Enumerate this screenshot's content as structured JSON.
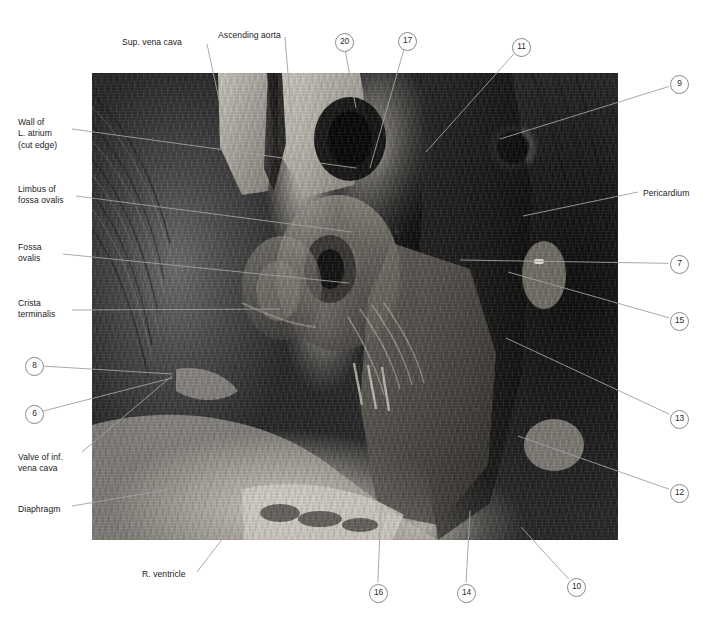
{
  "figure": {
    "type": "anatomical-photograph-plate",
    "photo": {
      "x": 92,
      "y": 73,
      "width": 526,
      "height": 467,
      "rendering": "grayscale-photograph"
    },
    "colors": {
      "background": "#ffffff",
      "label_text": "#1b1b1b",
      "leader_line": "#a0a0a0",
      "circle_stroke": "#8b8b8b",
      "circle_text": "#2b2b2b"
    }
  },
  "text_labels": [
    {
      "id": "sup-vena-cava",
      "lines": [
        "Sup. vena cava"
      ],
      "x": 122,
      "y": 37,
      "align": "left",
      "anchor": [
        207,
        44
      ],
      "target": [
        232,
        160
      ]
    },
    {
      "id": "ascending-aorta",
      "lines": [
        "Ascending aorta"
      ],
      "x": 218,
      "y": 30,
      "align": "left",
      "anchor": [
        285,
        37
      ],
      "target": [
        292,
        123
      ]
    },
    {
      "id": "wall-l-atrium",
      "lines": [
        "Wall of",
        "L. atrium",
        "(cut edge)"
      ],
      "x": 18,
      "y": 117,
      "align": "left",
      "anchor": [
        72,
        129
      ],
      "target": [
        356,
        168
      ]
    },
    {
      "id": "limbus-fossa-ovalis",
      "lines": [
        "Limbus of",
        "fossa ovalis"
      ],
      "x": 18,
      "y": 184,
      "align": "left",
      "anchor": [
        76,
        196
      ],
      "target": [
        352,
        232
      ]
    },
    {
      "id": "fossa-ovalis",
      "lines": [
        "Fossa",
        "ovalis"
      ],
      "x": 18,
      "y": 242,
      "align": "left",
      "anchor": [
        63,
        254
      ],
      "target": [
        349,
        283
      ]
    },
    {
      "id": "crista-terminalis",
      "lines": [
        "Crista",
        "terminalis"
      ],
      "x": 18,
      "y": 298,
      "align": "left",
      "anchor": [
        72,
        310
      ],
      "target": [
        280,
        309
      ]
    },
    {
      "id": "valve-inf-vena-cava",
      "lines": [
        "Valve of inf.",
        "vena cava"
      ],
      "x": 18,
      "y": 452,
      "align": "left",
      "anchor": [
        82,
        452
      ],
      "target": [
        172,
        376
      ]
    },
    {
      "id": "diaphragm",
      "lines": [
        "Diaphragm"
      ],
      "x": 18,
      "y": 504,
      "align": "left",
      "anchor": [
        72,
        506
      ],
      "target": [
        166,
        490
      ]
    },
    {
      "id": "r-ventricle",
      "lines": [
        "R. ventricle"
      ],
      "x": 142,
      "y": 569,
      "align": "left",
      "anchor": [
        197,
        572
      ],
      "target": [
        236,
        521
      ]
    },
    {
      "id": "pericardium",
      "lines": [
        "Pericardium"
      ],
      "x": 643,
      "y": 188,
      "align": "left",
      "anchor": [
        638,
        192
      ],
      "target": [
        523,
        216
      ]
    }
  ],
  "numbered_markers": [
    {
      "id": "marker-20",
      "label": "20",
      "x": 335,
      "y": 33,
      "target": [
        356,
        108
      ]
    },
    {
      "id": "marker-17",
      "label": "17",
      "x": 398,
      "y": 32,
      "target": [
        370,
        168
      ]
    },
    {
      "id": "marker-11",
      "label": "11",
      "x": 512,
      "y": 38,
      "target": [
        426,
        152
      ]
    },
    {
      "id": "marker-9",
      "label": "9",
      "x": 670,
      "y": 75,
      "target": [
        500,
        139
      ]
    },
    {
      "id": "marker-7",
      "label": "7",
      "x": 670,
      "y": 255,
      "target": [
        460,
        260
      ]
    },
    {
      "id": "marker-15",
      "label": "15",
      "x": 670,
      "y": 312,
      "target": [
        508,
        272
      ]
    },
    {
      "id": "marker-13",
      "label": "13",
      "x": 670,
      "y": 410,
      "target": [
        506,
        338
      ]
    },
    {
      "id": "marker-12",
      "label": "12",
      "x": 670,
      "y": 484,
      "target": [
        518,
        436
      ]
    },
    {
      "id": "marker-8",
      "label": "8",
      "x": 25,
      "y": 357,
      "target": [
        172,
        374
      ]
    },
    {
      "id": "marker-6",
      "label": "6",
      "x": 25,
      "y": 405,
      "target": [
        172,
        378
      ]
    },
    {
      "id": "marker-16",
      "label": "16",
      "x": 369,
      "y": 584,
      "target": [
        381,
        505
      ]
    },
    {
      "id": "marker-14",
      "label": "14",
      "x": 457,
      "y": 584,
      "target": [
        470,
        511
      ]
    },
    {
      "id": "marker-10",
      "label": "10",
      "x": 567,
      "y": 578,
      "target": [
        521,
        527
      ]
    }
  ]
}
